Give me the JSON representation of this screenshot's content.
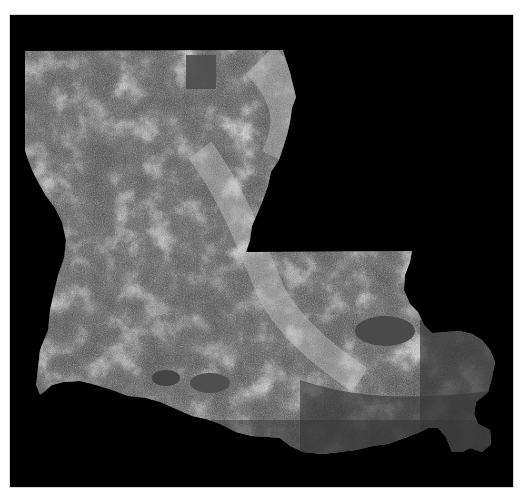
{
  "map": {
    "subject": "Louisiana",
    "style": "grayscale satellite land-cover imagery",
    "background_color": "#000000",
    "frame_color": "#ffffff",
    "land_tone_dark": "#3c3c3c",
    "land_tone_mid": "#6e6e6e",
    "land_tone_light": "#d2d2d2",
    "water_tone": "#4a4a4a"
  }
}
